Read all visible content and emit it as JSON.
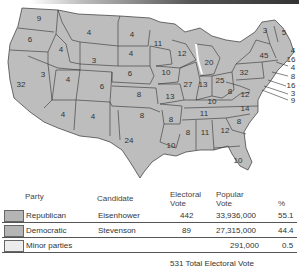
{
  "map": {
    "fill_color": "#bdbdbd",
    "border_color": "#333333",
    "states": [
      {
        "abbr": "WA",
        "votes": "9",
        "x": 39,
        "y": 19
      },
      {
        "abbr": "OR",
        "votes": "6",
        "x": 30,
        "y": 40
      },
      {
        "abbr": "CA",
        "votes": "32",
        "x": 21,
        "y": 85
      },
      {
        "abbr": "NV",
        "votes": "3",
        "x": 43,
        "y": 75
      },
      {
        "abbr": "ID",
        "votes": "4",
        "x": 61,
        "y": 50
      },
      {
        "abbr": "MT",
        "votes": "4",
        "x": 89,
        "y": 33
      },
      {
        "abbr": "WY",
        "votes": "3",
        "x": 94,
        "y": 61
      },
      {
        "abbr": "UT",
        "votes": "4",
        "x": 68,
        "y": 80
      },
      {
        "abbr": "AZ",
        "votes": "4",
        "x": 63,
        "y": 115
      },
      {
        "abbr": "CO",
        "votes": "6",
        "x": 102,
        "y": 87
      },
      {
        "abbr": "NM",
        "votes": "4",
        "x": 93,
        "y": 117
      },
      {
        "abbr": "ND",
        "votes": "4",
        "x": 132,
        "y": 35
      },
      {
        "abbr": "SD",
        "votes": "4",
        "x": 131,
        "y": 54
      },
      {
        "abbr": "NE",
        "votes": "6",
        "x": 130,
        "y": 74
      },
      {
        "abbr": "KS",
        "votes": "8",
        "x": 139,
        "y": 95
      },
      {
        "abbr": "OK",
        "votes": "8",
        "x": 142,
        "y": 116
      },
      {
        "abbr": "TX",
        "votes": "24",
        "x": 129,
        "y": 141
      },
      {
        "abbr": "MN",
        "votes": "11",
        "x": 158,
        "y": 44
      },
      {
        "abbr": "IA",
        "votes": "10",
        "x": 166,
        "y": 73
      },
      {
        "abbr": "MO",
        "votes": "13",
        "x": 170,
        "y": 97
      },
      {
        "abbr": "AR",
        "votes": "8",
        "x": 171,
        "y": 120
      },
      {
        "abbr": "LA",
        "votes": "10",
        "x": 171,
        "y": 146
      },
      {
        "abbr": "WI",
        "votes": "12",
        "x": 182,
        "y": 54
      },
      {
        "abbr": "IL",
        "votes": "27",
        "x": 188,
        "y": 85
      },
      {
        "abbr": "MI",
        "votes": "20",
        "x": 209,
        "y": 63
      },
      {
        "abbr": "IN",
        "votes": "13",
        "x": 203,
        "y": 85
      },
      {
        "abbr": "OH",
        "votes": "25",
        "x": 220,
        "y": 81
      },
      {
        "abbr": "KY",
        "votes": "10",
        "x": 212,
        "y": 102
      },
      {
        "abbr": "TN",
        "votes": "11",
        "x": 204,
        "y": 114
      },
      {
        "abbr": "MS",
        "votes": "8",
        "x": 188,
        "y": 133
      },
      {
        "abbr": "AL",
        "votes": "11",
        "x": 205,
        "y": 133
      },
      {
        "abbr": "GA",
        "votes": "12",
        "x": 225,
        "y": 131
      },
      {
        "abbr": "FL",
        "votes": "10",
        "x": 238,
        "y": 161
      },
      {
        "abbr": "SC",
        "votes": "8",
        "x": 239,
        "y": 122
      },
      {
        "abbr": "NC",
        "votes": "14",
        "x": 245,
        "y": 109
      },
      {
        "abbr": "VA",
        "votes": "12",
        "x": 245,
        "y": 95
      },
      {
        "abbr": "WV",
        "votes": "8",
        "x": 230,
        "y": 92
      },
      {
        "abbr": "PA",
        "votes": "32",
        "x": 244,
        "y": 73
      },
      {
        "abbr": "NY",
        "votes": "45",
        "x": 264,
        "y": 56
      }
    ],
    "callouts": [
      {
        "label": "3",
        "x": 265,
        "y": 31
      },
      {
        "label": "5",
        "x": 284,
        "y": 33
      },
      {
        "label": "4",
        "x": 293,
        "y": 51
      },
      {
        "label": "16",
        "x": 291,
        "y": 60
      },
      {
        "label": "4",
        "x": 293,
        "y": 68
      },
      {
        "label": "8",
        "x": 293,
        "y": 77
      },
      {
        "label": "16",
        "x": 291,
        "y": 86
      },
      {
        "label": "3",
        "x": 293,
        "y": 94
      },
      {
        "label": "9",
        "x": 293,
        "y": 101
      }
    ]
  },
  "table": {
    "headers": {
      "party": "Party",
      "candidate": "Candidate",
      "electoral": "Electoral Vote",
      "popular": "Popular Vote",
      "percent": "%"
    },
    "rows": [
      {
        "party": "Republican",
        "candidate": "Eisenhower",
        "electoral": "442",
        "popular": "33,936,000",
        "percent": "55.1",
        "swatch": "#b5b5b5"
      },
      {
        "party": "Democratic",
        "candidate": "Stevenson",
        "electoral": "89",
        "popular": "27,315,000",
        "percent": "44.4",
        "swatch": "#b5b5b5"
      },
      {
        "party": "Minor parties",
        "candidate": "",
        "electoral": "",
        "popular": "291,000",
        "percent": "0.5",
        "swatch": "#ececec"
      }
    ],
    "total": "531 Total Electoral Vote"
  }
}
